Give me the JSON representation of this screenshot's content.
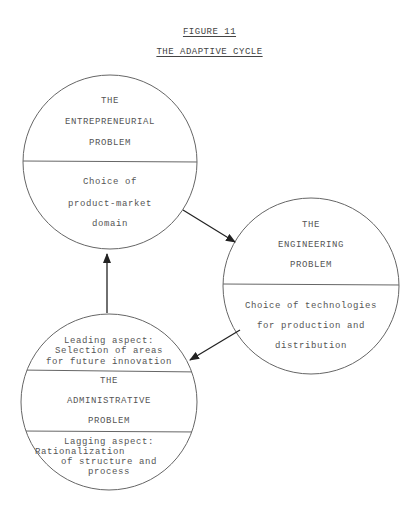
{
  "figure": {
    "number": "FIGURE 11",
    "title": "THE ADAPTIVE CYCLE"
  },
  "nodes": [
    {
      "id": "entrepreneurial",
      "heading": [
        "THE",
        "ENTREPRENEURIAL",
        "PROBLEM"
      ],
      "body": [
        "Choice of",
        "product-market",
        "domain"
      ]
    },
    {
      "id": "engineering",
      "heading": [
        "THE",
        "ENGINEERING",
        "PROBLEM"
      ],
      "body": [
        "Choice of technologies",
        "for production and",
        "distribution"
      ]
    },
    {
      "id": "administrative",
      "top": [
        "Leading aspect:",
        "Selection of areas",
        "for future innovation"
      ],
      "heading": [
        "THE",
        "ADMINISTRATIVE",
        "PROBLEM"
      ],
      "body": [
        "Lagging aspect:",
        "Rationalization",
        "of structure and",
        "process"
      ]
    }
  ],
  "edges": [
    {
      "from": "entrepreneurial",
      "to": "engineering"
    },
    {
      "from": "engineering",
      "to": "administrative"
    },
    {
      "from": "administrative",
      "to": "entrepreneurial"
    }
  ],
  "colors": {
    "line": "#555555",
    "text": "#555555",
    "background": "#ffffff"
  }
}
